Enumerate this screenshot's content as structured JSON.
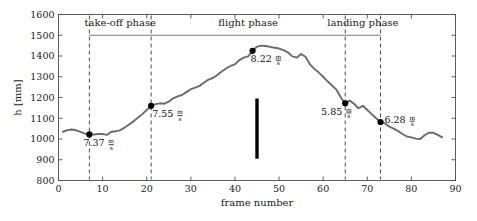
{
  "chart_data": {
    "type": "line",
    "title": "",
    "xlabel": "frame number",
    "ylabel": "h [mm]",
    "xlim": [
      0,
      90
    ],
    "ylim": [
      800,
      1600
    ],
    "xticks": [
      0,
      10,
      20,
      30,
      40,
      50,
      60,
      70,
      80,
      90
    ],
    "yticks": [
      800,
      900,
      1000,
      1100,
      1200,
      1300,
      1400,
      1500,
      1600
    ],
    "grid": false,
    "legend": "none",
    "line_color": "#6b6b6b",
    "marker_color": "#000000",
    "series": [
      {
        "name": "h",
        "x": [
          1,
          2,
          3,
          4,
          5,
          6,
          7,
          8,
          9,
          10,
          11,
          12,
          13,
          14,
          15,
          16,
          17,
          18,
          19,
          20,
          21,
          22,
          23,
          24,
          25,
          26,
          27,
          28,
          29,
          30,
          31,
          32,
          33,
          34,
          35,
          36,
          37,
          38,
          39,
          40,
          41,
          42,
          43,
          44,
          45,
          46,
          47,
          48,
          49,
          50,
          51,
          52,
          53,
          54,
          55,
          56,
          57,
          58,
          59,
          60,
          61,
          62,
          63,
          64,
          65,
          66,
          67,
          68,
          69,
          70,
          71,
          72,
          73,
          74,
          75,
          76,
          77,
          78,
          79,
          80,
          81,
          82,
          83,
          84,
          85,
          86,
          87
        ],
        "y": [
          1035,
          1043,
          1046,
          1042,
          1034,
          1026,
          1022,
          1022,
          1024,
          1024,
          1020,
          1035,
          1037,
          1043,
          1055,
          1070,
          1085,
          1102,
          1120,
          1140,
          1160,
          1168,
          1172,
          1170,
          1180,
          1196,
          1205,
          1212,
          1226,
          1240,
          1248,
          1256,
          1272,
          1286,
          1294,
          1308,
          1325,
          1340,
          1352,
          1360,
          1380,
          1392,
          1398,
          1425,
          1445,
          1450,
          1448,
          1444,
          1440,
          1436,
          1428,
          1418,
          1398,
          1392,
          1410,
          1396,
          1360,
          1338,
          1320,
          1300,
          1278,
          1258,
          1238,
          1200,
          1172,
          1185,
          1170,
          1148,
          1160,
          1140,
          1120,
          1100,
          1082,
          1075,
          1060,
          1050,
          1038,
          1024,
          1012,
          1008,
          1002,
          1000,
          1018,
          1030,
          1030,
          1020,
          1008
        ]
      }
    ],
    "annotations": [
      {
        "name": "take-off-speed",
        "frame": 7,
        "h": 1022,
        "value": "7.37",
        "unit_num": "m",
        "unit_den": "s",
        "label_x": 7,
        "label_y": 965,
        "align": "start",
        "dx": -6
      },
      {
        "name": "transition-speed",
        "frame": 21,
        "h": 1160,
        "value": "7.55",
        "unit_num": "m",
        "unit_den": "s",
        "label_x": 21,
        "label_y": 1105,
        "align": "start",
        "dx": 1
      },
      {
        "name": "apex-speed",
        "frame": 44,
        "h": 1425,
        "value": "8.22",
        "unit_num": "m",
        "unit_den": "s",
        "label_x": 44,
        "label_y": 1372,
        "align": "start",
        "dx": -2
      },
      {
        "name": "descent-speed",
        "frame": 65,
        "h": 1172,
        "value": "5.85",
        "unit_num": "m",
        "unit_den": "s",
        "label_x": 65,
        "label_y": 1118,
        "align": "end",
        "dx": -3
      },
      {
        "name": "landing-speed",
        "frame": 73,
        "h": 1082,
        "value": "6.28",
        "unit_num": "m",
        "unit_den": "s",
        "label_x": 73,
        "label_y": 1078,
        "align": "start",
        "dx": 4
      }
    ],
    "phase_dividers": [
      7,
      21,
      65,
      73
    ],
    "phases": [
      {
        "name": "take-off phase",
        "start": 7,
        "end": 21,
        "label_frame": 14,
        "bracket": true
      },
      {
        "name": "flight phase",
        "start": 21,
        "end": 65,
        "label_frame": 43,
        "bracket": true
      },
      {
        "name": "landing phase",
        "start": 65,
        "end": 73,
        "label_frame": 69,
        "bracket": true
      }
    ],
    "event_marker": {
      "name": "landing-bar",
      "frame": 45,
      "y_top": 1195,
      "y_bottom": 905,
      "color": "#000000",
      "width": 3.4
    }
  }
}
